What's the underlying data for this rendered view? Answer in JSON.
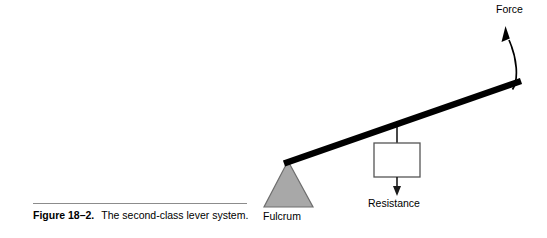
{
  "figure": {
    "caption_number": "Figure 18–2.",
    "caption_title": "The second-class lever system.",
    "labels": {
      "force": "Force",
      "fulcrum": "Fulcrum",
      "resistance": "Resistance"
    },
    "colors": {
      "background": "#ffffff",
      "lever_bar": "#000000",
      "fulcrum_fill": "#a8a8a8",
      "fulcrum_stroke": "#6e6e6e",
      "resistance_box_fill": "#ffffff",
      "resistance_box_stroke": "#555555",
      "arrow": "#000000",
      "caption_rule": "#8c8c8c",
      "text": "#000000"
    },
    "geometry": {
      "lever_bar": {
        "x1": 284,
        "y1": 163,
        "x2": 521,
        "y2": 81,
        "thickness": 6
      },
      "fulcrum_triangle": {
        "apex_x": 288,
        "apex_y": 162,
        "base_left_x": 265,
        "base_right_x": 312,
        "base_y": 207
      },
      "resistance_box": {
        "x": 374,
        "y": 143,
        "width": 46,
        "height": 34
      },
      "resistance_hanger": {
        "x": 397,
        "y_top": 122,
        "y_bottom": 143
      },
      "resistance_arrow": {
        "x": 397,
        "y_top": 177,
        "y_tip": 195
      },
      "force_arrow": {
        "tail_x": 512,
        "tail_y": 89,
        "tip_x": 505,
        "tip_y": 26
      }
    }
  }
}
